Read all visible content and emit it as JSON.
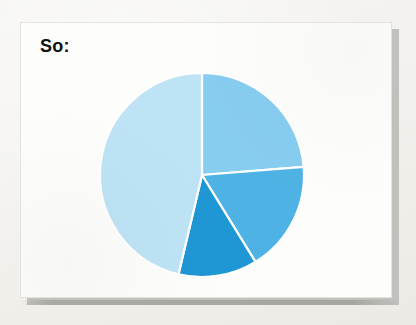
{
  "slide": {
    "title": "So:",
    "background_color": "#f3f2ee",
    "card_color": "#fdfdfb",
    "shadow_color": "#b9b9b4",
    "title_color": "#121212"
  },
  "chart_data": {
    "type": "pie",
    "title": "So:",
    "subtitle": "",
    "xlabel": "",
    "ylabel": "",
    "legend": "none",
    "grid": false,
    "labels": [
      "Slice 1",
      "Slice 2",
      "Slice 3",
      "Slice 4"
    ],
    "values": [
      23.7,
      17.5,
      12.5,
      46.3
    ],
    "units": "percent",
    "start_angle_deg": 0,
    "direction": "clockwise",
    "slice_boundaries_deg": [
      0,
      85.4,
      148.4,
      193.3,
      360
    ],
    "colors": [
      "#87cdf0",
      "#4eb3e4",
      "#1f97d4",
      "#bde3f5"
    ],
    "slice_border_color": "#ffffff",
    "center_px": [
      201,
      174
    ],
    "radius_px": 102,
    "annotations": []
  },
  "pie_geometry": {
    "cx": 181,
    "cy": 152,
    "r": 102,
    "slices": [
      {
        "name": "slice-1",
        "start": 0,
        "end": 85.4,
        "color": "#87cdf0"
      },
      {
        "name": "slice-2",
        "start": 85.4,
        "end": 148.4,
        "color": "#4eb3e4"
      },
      {
        "name": "slice-3",
        "start": 148.4,
        "end": 193.3,
        "color": "#1f97d4"
      },
      {
        "name": "slice-4",
        "start": 193.3,
        "end": 360,
        "color": "#bde3f5"
      }
    ]
  }
}
